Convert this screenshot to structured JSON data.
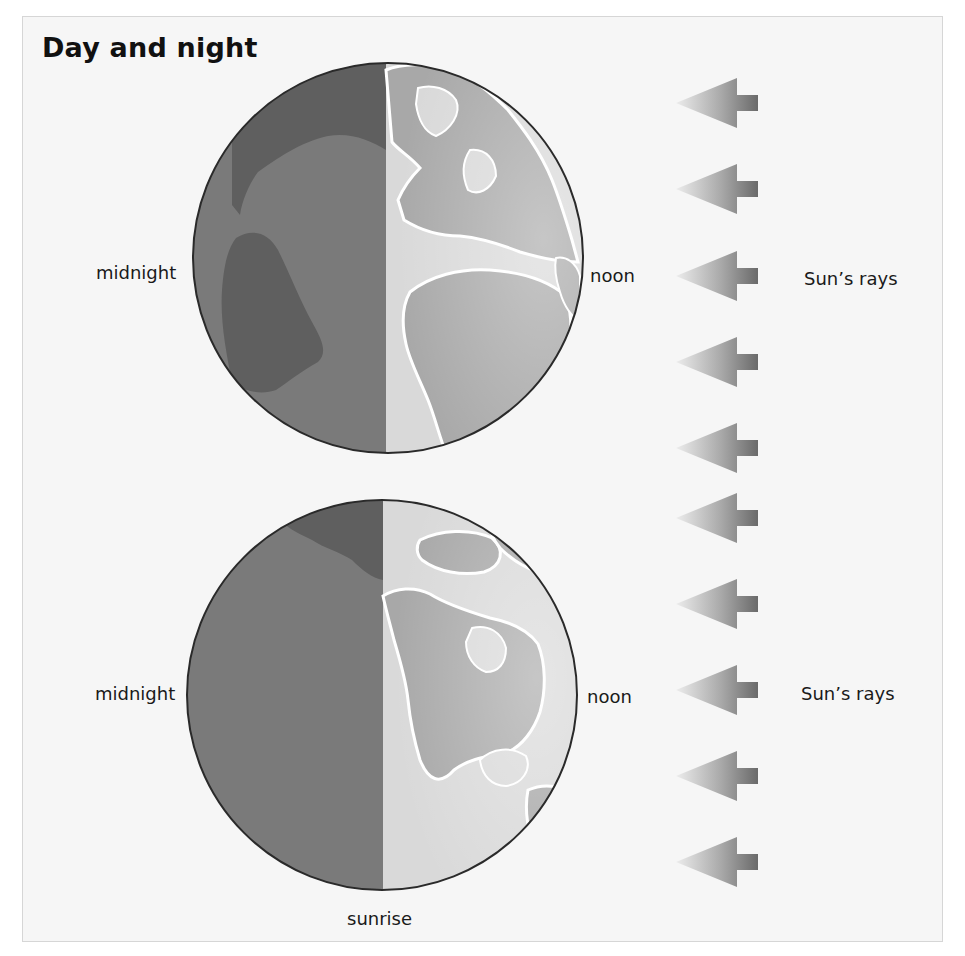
{
  "title": "Day and night",
  "colors": {
    "panel_background": "#f6f6f6",
    "panel_border": "#d6d6d6",
    "night_ocean": "#7a7a7a",
    "night_land": "#5f5f5f",
    "day_ocean": "#d9d9d9",
    "day_land": "#a8a8a8",
    "coast_outline": "#ffffff",
    "globe_outline": "#2a2a2a",
    "arrow_dark": "#6e6e6e",
    "arrow_light": "#e4e4e4"
  },
  "globes": [
    {
      "id": "globe-europe-africa",
      "view": "Europe, Africa and Atlantic",
      "labels": {
        "left": "midnight",
        "right": "noon"
      },
      "center": [
        388,
        258
      ],
      "radius": 195,
      "terminator_x": 386
    },
    {
      "id": "globe-north-america",
      "view": "North America and Pacific",
      "labels": {
        "left": "midnight",
        "right": "noon",
        "bottom": "sunrise"
      },
      "center": [
        382,
        695
      ],
      "radius": 195,
      "terminator_x": 383
    }
  ],
  "sun_rays": {
    "labels": [
      "Sun’s rays",
      "Sun’s rays"
    ],
    "arrow_direction": "left",
    "arrow_count": 10,
    "arrow_tip_y": [
      103,
      189,
      276,
      362,
      448,
      518,
      604,
      690,
      776,
      862
    ]
  }
}
